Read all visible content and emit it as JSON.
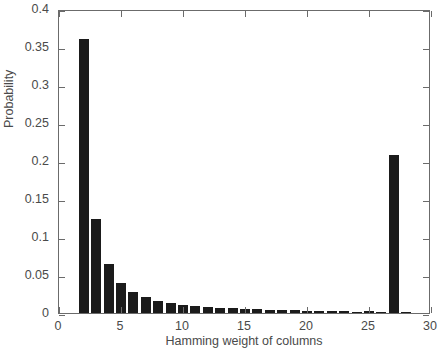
{
  "chart_data": {
    "type": "bar",
    "title": "",
    "subtitle": "",
    "xlabel": "Hamming weight of columns",
    "ylabel": "Probability",
    "xlim": [
      0,
      30
    ],
    "ylim": [
      0,
      0.4
    ],
    "xticks": [
      0,
      5,
      10,
      15,
      20,
      25,
      30
    ],
    "xticklabels": [
      "0",
      "5",
      "10",
      "15",
      "20",
      "25",
      "30"
    ],
    "yticks": [
      0,
      0.05,
      0.1,
      0.15,
      0.2,
      0.25,
      0.3,
      0.35,
      0.4
    ],
    "yticklabels": [
      "0",
      "0.05",
      "0.1",
      "0.15",
      "0.2",
      "0.25",
      "0.3",
      "0.35",
      "0.4"
    ],
    "grid": false,
    "legend": null,
    "legend_position": "none",
    "bar_color": "#1b1b1b",
    "axis_color": "#6b6b6b",
    "bar_width": 0.82,
    "categories": [
      2,
      3,
      4,
      5,
      6,
      7,
      8,
      9,
      10,
      11,
      12,
      13,
      14,
      15,
      16,
      17,
      18,
      19,
      20,
      21,
      22,
      23,
      24,
      25,
      26,
      27,
      28
    ],
    "values": [
      0.36,
      0.124,
      0.064,
      0.04,
      0.028,
      0.021,
      0.016,
      0.013,
      0.0105,
      0.009,
      0.008,
      0.0068,
      0.006,
      0.0054,
      0.0048,
      0.0042,
      0.0038,
      0.0034,
      0.003,
      0.0026,
      0.0023,
      0.002,
      0.0018,
      0.0026,
      0.0014,
      0.208,
      0.0006
    ],
    "series": [
      {
        "name": "Probability",
        "values": [
          0.36,
          0.124,
          0.064,
          0.04,
          0.028,
          0.021,
          0.016,
          0.013,
          0.0105,
          0.009,
          0.008,
          0.0068,
          0.006,
          0.0054,
          0.0048,
          0.0042,
          0.0038,
          0.0034,
          0.003,
          0.0026,
          0.0023,
          0.002,
          0.0018,
          0.0026,
          0.0014,
          0.208,
          0.0006
        ]
      }
    ],
    "annotations": []
  }
}
